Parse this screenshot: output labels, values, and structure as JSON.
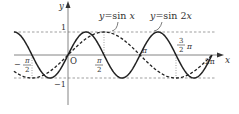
{
  "chart_data": {
    "type": "line",
    "title": "",
    "xlabel": "x",
    "ylabel": "y",
    "origin_label": "O",
    "xlim": [
      -2.36,
      6.6
    ],
    "ylim": [
      -1.5,
      2.3
    ],
    "grid": false,
    "legend_position": "annotations above curves",
    "x_ticks": [
      {
        "value": -1.5708,
        "label": "-π/2",
        "num": "π",
        "den": "2",
        "sign": "−"
      },
      {
        "value": 1.5708,
        "label": "π/2",
        "num": "π",
        "den": "2"
      },
      {
        "value": 3.1416,
        "label": "π"
      },
      {
        "value": 4.7124,
        "label": "3/2 π",
        "num": "3",
        "den": "2",
        "suffix": "π"
      },
      {
        "value": 6.2832,
        "label": "2π"
      }
    ],
    "y_ticks": [
      {
        "value": 1,
        "label": "1"
      },
      {
        "value": -1,
        "label": "−1"
      }
    ],
    "reference_lines": [
      {
        "type": "horizontal",
        "y": 1,
        "style": "dashed"
      },
      {
        "type": "horizontal",
        "y": -1,
        "style": "dashed"
      },
      {
        "type": "vertical",
        "x": -1.5708,
        "from": 0,
        "to": -1,
        "style": "dotted"
      },
      {
        "type": "vertical",
        "x": 1.5708,
        "from": 0,
        "to": 1,
        "style": "dotted"
      },
      {
        "type": "vertical",
        "x": 4.7124,
        "from": 0,
        "to": -1,
        "style": "dotted"
      }
    ],
    "series": [
      {
        "name": "y=sin x",
        "function": "sin(x)",
        "style": "dashed",
        "x_range": [
          -2.36,
          6.2832
        ],
        "x": [
          -2.36,
          -1.5708,
          0,
          1.5708,
          3.1416,
          4.7124,
          6.2832
        ],
        "values": [
          -0.7,
          -1,
          0,
          1,
          0,
          -1,
          0
        ]
      },
      {
        "name": "y=sin 2x",
        "function": "sin(2x)",
        "style": "solid",
        "x_range": [
          -2.36,
          6.2832
        ],
        "x": [
          -2.36,
          -1.5708,
          -0.7854,
          0,
          0.7854,
          1.5708,
          2.3562,
          3.1416,
          3.927,
          4.7124,
          5.4978,
          6.2832
        ],
        "values": [
          1,
          0,
          -1,
          0,
          1,
          0,
          -1,
          0,
          1,
          0,
          -1,
          0
        ]
      }
    ],
    "annotations": [
      {
        "text": "y=sin x",
        "prefix": "y",
        "eq": "=sin ",
        "var": "x",
        "points_to": "sin x curve"
      },
      {
        "text": "y=sin 2x",
        "prefix": "y",
        "eq": "=sin 2",
        "var": "x",
        "points_to": "sin 2x curve"
      }
    ]
  },
  "colors": {
    "curve": "#222222",
    "axis": "#555555",
    "guide": "#777777"
  }
}
